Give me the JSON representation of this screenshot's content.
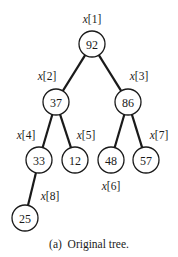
{
  "diagram": {
    "type": "binary-tree (heap array)",
    "nodes": [
      {
        "index_label": "x[1]",
        "value": "92",
        "cx": 92,
        "cy": 44,
        "lx": 92,
        "ly": 23
      },
      {
        "index_label": "x[2]",
        "value": "37",
        "cx": 56,
        "cy": 102,
        "lx": 47,
        "ly": 80
      },
      {
        "index_label": "x[3]",
        "value": "86",
        "cx": 128,
        "cy": 102,
        "lx": 139,
        "ly": 80
      },
      {
        "index_label": "x[4]",
        "value": "33",
        "cx": 39,
        "cy": 160,
        "lx": 26,
        "ly": 139
      },
      {
        "index_label": "x[5]",
        "value": "12",
        "cx": 75,
        "cy": 160,
        "lx": 86,
        "ly": 139
      },
      {
        "index_label": "x[6]",
        "value": "48",
        "cx": 111,
        "cy": 160,
        "lx": 111,
        "ly": 190
      },
      {
        "index_label": "x[7]",
        "value": "57",
        "cx": 146,
        "cy": 160,
        "lx": 159,
        "ly": 139
      },
      {
        "index_label": "x[8]",
        "value": "25",
        "cx": 25,
        "cy": 218,
        "lx": 50,
        "ly": 200
      }
    ],
    "edges": [
      [
        0,
        1
      ],
      [
        0,
        2
      ],
      [
        1,
        3
      ],
      [
        1,
        4
      ],
      [
        2,
        5
      ],
      [
        2,
        6
      ],
      [
        3,
        7
      ]
    ],
    "caption": "(a)  Original tree."
  }
}
